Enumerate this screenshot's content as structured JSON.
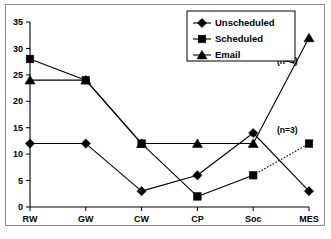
{
  "chart_data": {
    "type": "line",
    "title": "",
    "subtitle": "",
    "xlabel": "",
    "ylabel": "",
    "categories": [
      "RW",
      "GW",
      "CW",
      "CP",
      "Soc",
      "MES"
    ],
    "ylim": [
      0,
      35
    ],
    "y_ticks": [
      0,
      5,
      10,
      15,
      20,
      25,
      30,
      35
    ],
    "grid": false,
    "legend_position": "top-right",
    "series": [
      {
        "name": "Unscheduled",
        "marker": "diamond",
        "line_style": "solid",
        "color": "#000000",
        "values": [
          12,
          12,
          3,
          6,
          14,
          3
        ]
      },
      {
        "name": "Scheduled",
        "marker": "square",
        "line_style": "solid",
        "color": "#000000",
        "values": [
          28,
          24,
          12,
          2,
          6,
          12
        ],
        "dotted_segments": [
          [
            4,
            5
          ]
        ]
      },
      {
        "name": "Email",
        "marker": "triangle",
        "line_style": "solid",
        "color": "#000000",
        "values": [
          24,
          24,
          12,
          12,
          12,
          32
        ]
      }
    ],
    "annotations": [
      {
        "text": "(n=4)",
        "x_category": "MES",
        "y_value": 27,
        "series": "Email"
      },
      {
        "text": "(n=3)",
        "x_category": "MES",
        "y_value": 14,
        "series": "Scheduled"
      }
    ]
  },
  "legend": {
    "items": [
      {
        "label": "Unscheduled",
        "marker": "diamond"
      },
      {
        "label": "Scheduled",
        "marker": "square"
      },
      {
        "label": "Email",
        "marker": "triangle"
      }
    ]
  },
  "axes": {
    "y_tick_labels": [
      "0",
      "5",
      "10",
      "15",
      "20",
      "25",
      "30",
      "35"
    ],
    "x_tick_labels": [
      "RW",
      "GW",
      "CW",
      "CP",
      "Soc",
      "MES"
    ]
  }
}
